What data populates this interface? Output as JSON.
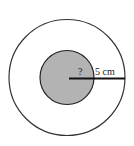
{
  "diagram": {
    "outer_circle": {
      "cx": 67,
      "cy": 77.5,
      "r": 58,
      "fill": "#ffffff",
      "stroke": "#333333"
    },
    "inner_circle": {
      "cx": 67,
      "cy": 77.5,
      "r": 27,
      "fill": "#b3b3b3",
      "stroke": "#222222"
    },
    "radius_line": {
      "x1": 69,
      "y1": 78.5,
      "x2": 125,
      "y2": 78.5,
      "stroke": "#111111"
    },
    "unknown_label": "?",
    "measure_label": "5 cm"
  }
}
